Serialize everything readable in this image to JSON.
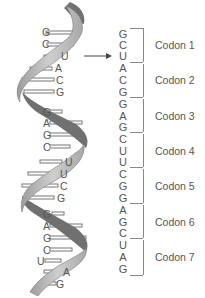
{
  "diagram": {
    "type": "mRNA helix to codon sequence",
    "helix_bases": [
      "G",
      "C",
      "U",
      "A",
      "C",
      "G",
      "G",
      "A",
      "G",
      "C",
      "U",
      "U",
      "C",
      "G",
      "G",
      "A",
      "G",
      "C",
      "U",
      "A",
      "G"
    ],
    "sequence": [
      "G",
      "C",
      "U",
      "A",
      "C",
      "G",
      "G",
      "A",
      "G",
      "C",
      "U",
      "U",
      "C",
      "G",
      "G",
      "A",
      "G",
      "C",
      "U",
      "A",
      "G"
    ],
    "codons": [
      {
        "label": "Codon 1",
        "bases": "GCU"
      },
      {
        "label": "Codon 2",
        "bases": "ACG"
      },
      {
        "label": "Codon 3",
        "bases": "GAG"
      },
      {
        "label": "Codon 4",
        "bases": "CUU"
      },
      {
        "label": "Codon 5",
        "bases": "CGG"
      },
      {
        "label": "Codon 6",
        "bases": "AGC"
      },
      {
        "label": "Codon 7",
        "bases": "UAG"
      }
    ],
    "colors": {
      "ribbon_light": "#b8b8b8",
      "ribbon_dark": "#6e6e6e",
      "text": "#555555",
      "bracket": "#888888"
    }
  }
}
